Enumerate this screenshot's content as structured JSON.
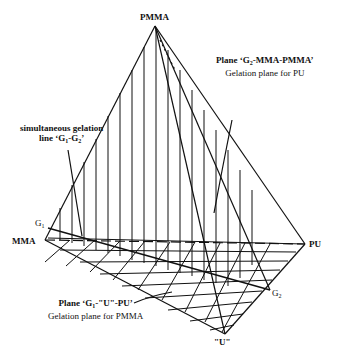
{
  "figure": {
    "type": "ternary-prism gelation diagram",
    "vertices": {
      "apex": "PMMA",
      "left": "MMA",
      "right": "PU",
      "bottom": "\"U\"",
      "g1": "G",
      "g1_sub": "1",
      "g2": "G",
      "g2_sub": "2"
    },
    "annotations": {
      "plane_pu_line1_prefix": "Plane ‘G",
      "plane_pu_line1_sub": "2",
      "plane_pu_line1_suffix": "-MMA-PMMA’",
      "plane_pu_line2": "Gelation plane for PU",
      "simul_line1": "simultaneous gelation",
      "simul_line2_prefix": "line ‘G",
      "simul_line2_sub1": "1",
      "simul_line2_mid": "-G",
      "simul_line2_sub2": "2",
      "simul_line2_suffix": "’",
      "plane_pmma_line1_prefix": "Plane ‘G",
      "plane_pmma_line1_sub": "1",
      "plane_pmma_line1_suffix": "-\"U\"-PU’",
      "plane_pmma_line2": "Gelation plane for PMMA"
    },
    "colors": {
      "ink": "#111111",
      "background": "#ffffff"
    }
  }
}
